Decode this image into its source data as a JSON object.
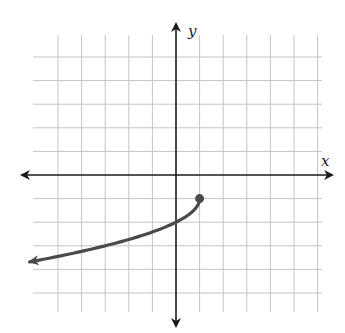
{
  "chart_data": {
    "type": "line",
    "title": "",
    "xlabel": "x",
    "ylabel": "y",
    "xlim": [
      -6,
      6
    ],
    "ylim": [
      -6,
      6
    ],
    "grid": true,
    "grid_step": 1,
    "legend": null,
    "series": [
      {
        "name": "f(x) = -sqrt(1 - x) - 1",
        "equation": "y = -√(1 − x) − 1",
        "x": [
          1,
          0.75,
          0,
          -1,
          -2,
          -3,
          -4,
          -5,
          -6.2
        ],
        "y": [
          -1,
          -1.5,
          -2,
          -2.41,
          -2.73,
          -3,
          -3.24,
          -3.45,
          -3.68
        ],
        "endpoint": {
          "x": 1,
          "y": -1,
          "style": "closed-dot"
        },
        "arrow_end": {
          "x": -6.2,
          "y": -3.68,
          "direction": "left"
        },
        "color": "#4a4a4a"
      }
    ]
  },
  "labels": {
    "x_axis": "x",
    "y_axis": "y"
  },
  "colors": {
    "grid": "#c4c4c4",
    "axis": "#1a1a1a",
    "curve": "#4a4a4a"
  }
}
